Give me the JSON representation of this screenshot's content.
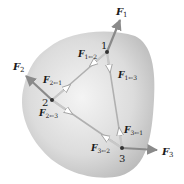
{
  "diagram": {
    "type": "rigid-body-internal-forces",
    "colors": {
      "body_fill_center": "#f2f2f2",
      "body_fill_edge": "#bdbdbd",
      "arrow": "#8a8a8a",
      "line": "#a8a8a8",
      "point": "#333333",
      "text": "#1a1a1a"
    },
    "points": [
      {
        "id": "1",
        "label": "1",
        "x": 107,
        "y": 52
      },
      {
        "id": "2",
        "label": "2",
        "x": 52,
        "y": 100
      },
      {
        "id": "3",
        "label": "3",
        "x": 122,
        "y": 148
      }
    ],
    "external_forces": [
      {
        "name": "F1",
        "main": "F",
        "sub": "1",
        "at": "1"
      },
      {
        "name": "F2",
        "main": "F",
        "sub": "2",
        "at": "2"
      },
      {
        "name": "F3",
        "main": "F",
        "sub": "3",
        "at": "3"
      }
    ],
    "internal_forces": [
      {
        "name": "F1←2",
        "main": "F",
        "sub": "1←2"
      },
      {
        "name": "F1←3",
        "main": "F",
        "sub": "1←3"
      },
      {
        "name": "F2←1",
        "main": "F",
        "sub": "2←1"
      },
      {
        "name": "F2←3",
        "main": "F",
        "sub": "2←3"
      },
      {
        "name": "F3←1",
        "main": "F",
        "sub": "3←1"
      },
      {
        "name": "F3←2",
        "main": "F",
        "sub": "3←2"
      }
    ]
  }
}
